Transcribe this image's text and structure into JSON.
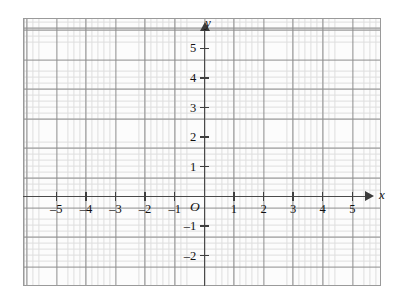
{
  "figure": {
    "kind": "cartesian-coordinate-grid",
    "background_color": "#ffffff",
    "plate_color": "#fcfcfc",
    "fine_grid_color": "#dedede",
    "major_grid_color": "#8d8d8d",
    "border_color": "#9a9a9a",
    "axis_color": "#4a4a4a",
    "text_color": "#111111"
  },
  "axes": {
    "x": {
      "name": "x",
      "arrow": "arrow-right",
      "tick_labels": [
        "–5",
        "–4",
        "–3",
        "–2",
        "–1",
        "1",
        "2",
        "3",
        "4",
        "5"
      ],
      "tick_values": [
        -5,
        -4,
        -3,
        -2,
        -1,
        1,
        2,
        3,
        4,
        5
      ]
    },
    "y": {
      "name": "y",
      "arrow": "arrow-up",
      "tick_labels": [
        "5",
        "4",
        "3",
        "2",
        "1",
        "–1",
        "–2"
      ],
      "tick_values": [
        5,
        4,
        3,
        2,
        1,
        -1,
        -2
      ]
    },
    "origin_label": "O"
  },
  "chart_data": {
    "type": "scatter",
    "title": "",
    "subtitle": "",
    "xlabel": "x",
    "ylabel": "y",
    "series": [],
    "annotations": [],
    "legend": null,
    "legend_position": "none",
    "grid": true,
    "minor_grid": true,
    "minor_ticks_per_unit": 5,
    "xlim": [
      -6.1,
      5.95
    ],
    "ylim": [
      -3.0,
      6.0
    ],
    "xticks": [
      -5,
      -4,
      -3,
      -2,
      -1,
      0,
      1,
      2,
      3,
      4,
      5
    ],
    "yticks": [
      -2,
      -1,
      0,
      1,
      2,
      3,
      4,
      5
    ],
    "xtick_labels": [
      "–5",
      "–4",
      "–3",
      "–2",
      "–1",
      "O",
      "1",
      "2",
      "3",
      "4",
      "5"
    ],
    "ytick_labels": [
      "–2",
      "–1",
      "O",
      "1",
      "2",
      "3",
      "4",
      "5"
    ],
    "origin_marked": true,
    "unit_px": 29.6
  }
}
